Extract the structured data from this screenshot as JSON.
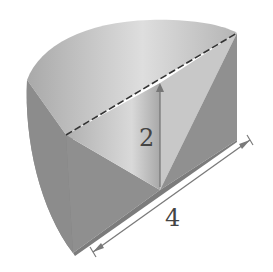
{
  "figure": {
    "type": "solid-geometry",
    "labels": {
      "height": "2",
      "length": "4"
    },
    "colors": {
      "top_light": "#d6d6d6",
      "top_mid": "#b4b4b4",
      "side_dark": "#8a8a8a",
      "face_mid": "#a6a6a6",
      "face_right": "#909090",
      "edge": "#333333",
      "dim_line": "#7a7a7a"
    }
  }
}
